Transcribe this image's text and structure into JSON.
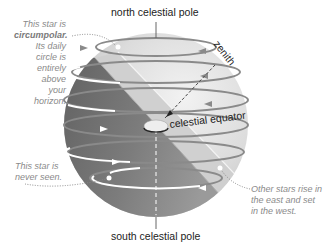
{
  "labels": {
    "north_pole": "north celestial pole",
    "south_pole": "south celestial pole",
    "zenith": "zenith",
    "equator": "celestial equator"
  },
  "notes": {
    "circumpolar": {
      "line1": "This star is",
      "line2_bold": "circumpolar.",
      "line3": "Its daily circle is",
      "line4": "entirely above",
      "line5": "your horizon."
    },
    "never_seen": {
      "line1": "This star is",
      "line2": "never seen."
    },
    "rise_set": {
      "line1": "Other stars rise in",
      "line2": "the east and set",
      "line3": "in the west."
    }
  },
  "colors": {
    "sphere_light": "#e6e6e6",
    "sphere_dark": "#6e6e6e",
    "horizon_plane": "#d4d4d4",
    "star_path": "#8a8a8a",
    "visible_path": "#ffffff",
    "note_text": "#8a8a8a"
  }
}
